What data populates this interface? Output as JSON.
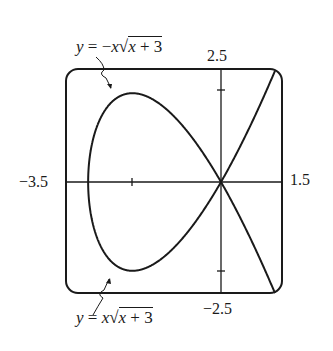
{
  "chart_data": {
    "type": "line",
    "title": "",
    "xlabel": "",
    "ylabel": "",
    "xlim": [
      -3.5,
      1.5
    ],
    "ylim": [
      -2.5,
      2.5
    ],
    "grid": false,
    "axes_through_origin": true,
    "tick_labels": {
      "x_min": "−3.5",
      "x_max": "1.5",
      "y_max": "2.5",
      "y_min": "−2.5"
    },
    "ticks": {
      "x": [
        -2
      ],
      "y": [
        2,
        -2
      ]
    },
    "series": [
      {
        "name": "y = −x√(x + 3)",
        "formula": "y = -x*sqrt(x+3)",
        "domain": [
          -3,
          1.5
        ],
        "x": [
          -3,
          -2.9,
          -2.5,
          -2,
          -1.5,
          -1,
          -0.5,
          0,
          0.5,
          1,
          1.5
        ],
        "values": [
          0,
          0.92,
          1.77,
          2.0,
          1.84,
          1.41,
          0.79,
          0,
          -0.94,
          -2.0,
          -3.18
        ]
      },
      {
        "name": "y = x√(x + 3)",
        "formula": "y = x*sqrt(x+3)",
        "domain": [
          -3,
          1.5
        ],
        "x": [
          -3,
          -2.9,
          -2.5,
          -2,
          -1.5,
          -1,
          -0.5,
          0,
          0.5,
          1,
          1.5
        ],
        "values": [
          0,
          -0.92,
          -1.77,
          -2.0,
          -1.84,
          -1.41,
          -0.79,
          0,
          0.94,
          2.0,
          3.18
        ]
      }
    ],
    "annotations": [
      {
        "text": "y = −x√x + 3",
        "points_to": "upper branch"
      },
      {
        "text": "y = x√x + 3",
        "points_to": "lower branch"
      }
    ]
  },
  "labels": {
    "top_eq": {
      "y": "y",
      "eq": " = −",
      "x": "x",
      "rad_x": "x",
      "rad_rest": " + 3",
      "sqrt": "√"
    },
    "bottom_eq": {
      "y": "y",
      "eq": " = ",
      "x": "x",
      "rad_x": "x",
      "rad_rest": " + 3",
      "sqrt": "√"
    },
    "x_min": "−3.5",
    "x_max": "1.5",
    "y_max": "2.5",
    "y_min": "−2.5"
  },
  "style": {
    "stroke": "#1a1a1a",
    "background": "#ffffff"
  }
}
